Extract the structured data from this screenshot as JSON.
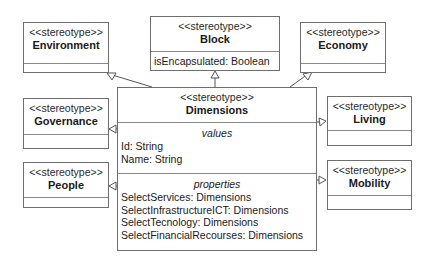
{
  "diagram": {
    "type": "UML class diagram",
    "stereotype_label": "<<stereotype>>",
    "classes": {
      "environment": {
        "stereotype": "<<stereotype>>",
        "name": "Environment",
        "attributes": []
      },
      "block": {
        "stereotype": "<<stereotype>>",
        "name": "Block",
        "attributes": [
          "isEncapsulated: Boolean"
        ]
      },
      "economy": {
        "stereotype": "<<stereotype>>",
        "name": "Economy",
        "attributes": []
      },
      "governance": {
        "stereotype": "<<stereotype>>",
        "name": "Governance",
        "attributes": []
      },
      "living": {
        "stereotype": "<<stereotype>>",
        "name": "Living",
        "attributes": []
      },
      "people": {
        "stereotype": "<<stereotype>>",
        "name": "People",
        "attributes": []
      },
      "mobility": {
        "stereotype": "<<stereotype>>",
        "name": "Mobility",
        "attributes": []
      },
      "dimensions": {
        "stereotype": "<<stereotype>>",
        "name": "Dimensions",
        "values_title": "values",
        "values": [
          "Id: String",
          "Name: String"
        ],
        "properties_title": "properties",
        "properties": [
          "SelectServices: Dimensions",
          "SelectInfrastructureICT: Dimensions",
          "SelectTecnology: Dimensions",
          "SelectFinancialRecourses: Dimensions"
        ]
      }
    },
    "relationships": [
      {
        "from": "Dimensions",
        "to": "Environment",
        "type": "generalization"
      },
      {
        "from": "Dimensions",
        "to": "Block",
        "type": "generalization"
      },
      {
        "from": "Dimensions",
        "to": "Economy",
        "type": "generalization"
      },
      {
        "from": "Dimensions",
        "to": "Governance",
        "type": "generalization"
      },
      {
        "from": "Dimensions",
        "to": "People",
        "type": "generalization"
      },
      {
        "from": "Dimensions",
        "to": "Living",
        "type": "generalization"
      },
      {
        "from": "Dimensions",
        "to": "Mobility",
        "type": "generalization"
      }
    ]
  }
}
